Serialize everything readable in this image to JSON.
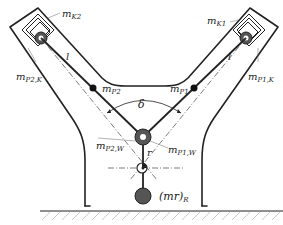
{
  "diagram": {
    "type": "mechanical-schematic",
    "labels": {
      "mK2": "m",
      "mK2_sub": "K2",
      "mK1": "m",
      "mK1_sub": "K1",
      "mP2K": "m",
      "mP2K_sub": "P2,K",
      "mP1K": "m",
      "mP1K_sub": "P1,K",
      "mP2": "m",
      "mP2_sub": "P2",
      "mP1": "m",
      "mP1_sub": "P1",
      "mP2W": "m",
      "mP2W_sub": "P2,W",
      "mP1W": "m",
      "mP1W_sub": "P1,W",
      "l_left": "l",
      "l_right": "l",
      "delta": "δ",
      "r": "r",
      "mr": "(mr)",
      "mr_sub": "R"
    },
    "colors": {
      "line": "#222222",
      "mass_fill": "#555555",
      "ground_hatch": "#999999"
    }
  }
}
